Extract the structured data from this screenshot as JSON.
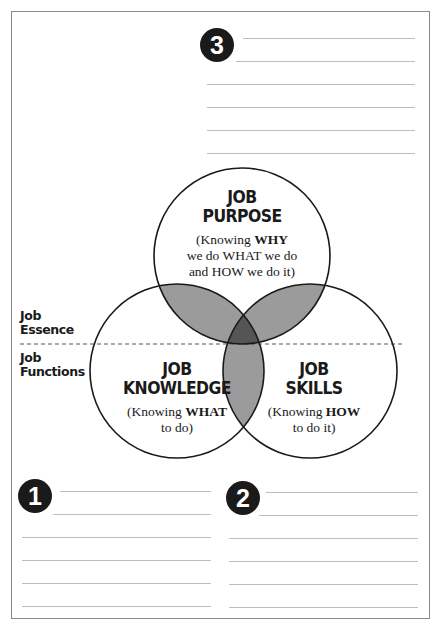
{
  "sections": {
    "top": {
      "number": "3",
      "line_count": 6
    },
    "bottom_left": {
      "number": "1",
      "line_count": 6
    },
    "bottom_right": {
      "number": "2",
      "line_count": 6
    }
  },
  "side_labels": {
    "upper": {
      "line1": "Job",
      "line2": "Essence"
    },
    "lower": {
      "line1": "Job",
      "line2": "Functions"
    }
  },
  "circles": {
    "purpose": {
      "title_line1": "JOB",
      "title_line2": "PURPOSE",
      "sub_pre": "(Knowing ",
      "sub_bold": "WHY",
      "sub_line2": "we do WHAT we do",
      "sub_line3": "and HOW we do it)"
    },
    "knowledge": {
      "title_line1": "JOB",
      "title_line2": "KNOWLEDGE",
      "sub_pre": "(Knowing ",
      "sub_bold": "WHAT",
      "sub_line2": "to do)"
    },
    "skills": {
      "title_line1": "JOB",
      "title_line2": "SKILLS",
      "sub_pre": "(Knowing ",
      "sub_bold": "HOW",
      "sub_line2": "to do it)"
    }
  },
  "colors": {
    "overlap": "#9b9b9b",
    "center_overlap": "#555555",
    "badge": "#1a1a1a",
    "lines": "#bdbdbd"
  }
}
